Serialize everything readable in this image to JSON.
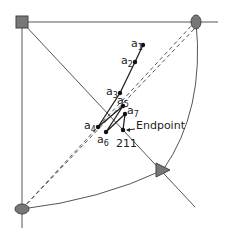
{
  "diagram": {
    "colors": {
      "line": "#555555",
      "trajectory": "#222222",
      "marker_fill": "#777777",
      "point": "#111111",
      "background": "#ffffff"
    },
    "markers": {
      "top_left": {
        "shape": "square",
        "x": 22,
        "y": 22
      },
      "top_right": {
        "shape": "ellipse",
        "x": 196,
        "y": 22
      },
      "bottom_left": {
        "shape": "ellipse",
        "x": 22,
        "y": 209
      },
      "triangle": {
        "shape": "triangle",
        "x": 163,
        "y": 170
      }
    },
    "points": [
      {
        "id": "a1",
        "base": "a",
        "sub": "1",
        "x": 143,
        "y": 45,
        "lx": 131,
        "ly": 47
      },
      {
        "id": "a2",
        "base": "a",
        "sub": "2",
        "x": 135,
        "y": 62,
        "lx": 121,
        "ly": 64
      },
      {
        "id": "a3",
        "base": "a",
        "sub": "3",
        "x": 120,
        "y": 93,
        "lx": 106,
        "ly": 95
      },
      {
        "id": "a5",
        "base": "a",
        "sub": "5",
        "x": 123,
        "y": 106,
        "lx": 117,
        "ly": 104
      },
      {
        "id": "a7",
        "base": "a",
        "sub": "7",
        "x": 125,
        "y": 114,
        "lx": 127,
        "ly": 114
      },
      {
        "id": "a4",
        "base": "a",
        "sub": "4",
        "x": 98,
        "y": 127,
        "lx": 84,
        "ly": 129
      },
      {
        "id": "a6",
        "base": "a",
        "sub": "6",
        "x": 106,
        "y": 132,
        "lx": 97,
        "ly": 145
      }
    ],
    "endpoint": {
      "label": "Endpoint",
      "x": 123,
      "y": 130,
      "label_x": 132,
      "label_y": 128
    },
    "step_label": {
      "text": "211",
      "x": 116,
      "y": 148
    }
  }
}
